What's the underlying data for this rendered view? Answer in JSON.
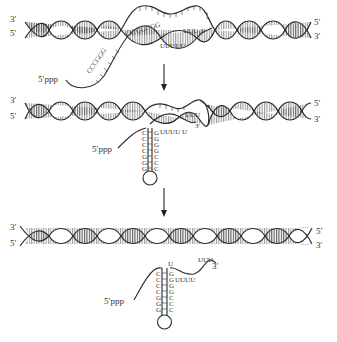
{
  "diagram": {
    "topic": "Rho-independent transcription termination",
    "stages": [
      {
        "id": "stage-1",
        "dna_left_labels": [
          "3′",
          "5′"
        ],
        "dna_right_labels": [
          "5′",
          "3′"
        ],
        "rna_5prime_label": "5′ppp",
        "rna_gc_bases_a": "CCCGGG",
        "rna_gc_bases_b": "CC CGGGG",
        "rna_u_bases": "UUU 3′",
        "template_u_bases": "UUUUU"
      },
      {
        "id": "stage-2",
        "dna_left_labels": [
          "3′",
          "5′"
        ],
        "dna_right_labels": [
          "5′",
          "3′"
        ],
        "rna_5prime_label": "5′ppp",
        "hairpin_left": [
          "C",
          "C",
          "C",
          "C",
          "G",
          "G",
          "G"
        ],
        "hairpin_right": [
          "G",
          "G",
          "G",
          "G",
          "C",
          "C",
          "C"
        ],
        "rna_u_bases": "UUUU U",
        "rna_3prime_u": "UUU",
        "rna_3prime_label": "3′"
      },
      {
        "id": "stage-3",
        "dna_left_labels": [
          "3′",
          "5′"
        ],
        "dna_right_labels": [
          "5′",
          "3′"
        ],
        "rna_5prime_label": "5′ppp",
        "hairpin_left": [
          "C",
          "C",
          "C",
          "C",
          "G",
          "G",
          "G"
        ],
        "hairpin_right": [
          "G",
          "G",
          "G",
          "G",
          "C",
          "C",
          "C"
        ],
        "top_u": "U",
        "rna_u_bases": "UUUU",
        "rna_3prime_u": "UUU",
        "rna_3prime_label": "3′"
      }
    ],
    "arrows": [
      "down-arrow-1",
      "down-arrow-2"
    ]
  }
}
